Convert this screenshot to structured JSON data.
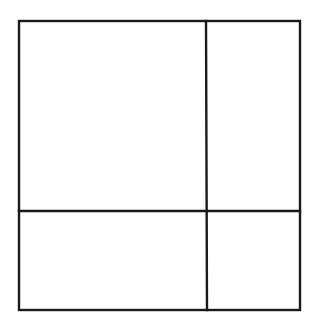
{
  "diagram": {
    "line_color": "#1a1a1a",
    "background_color": "#ffffff",
    "regions": [
      {
        "name": "top-left"
      },
      {
        "name": "top-right"
      },
      {
        "name": "bottom-left"
      },
      {
        "name": "bottom-right"
      }
    ]
  }
}
